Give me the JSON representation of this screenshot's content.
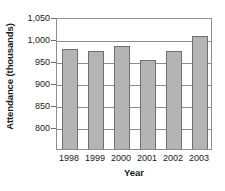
{
  "chart_data": {
    "type": "bar",
    "title": "",
    "subtitle": "",
    "xlabel": "Year",
    "ylabel": "Attendance (thousands)",
    "categories": [
      "1998",
      "1999",
      "2000",
      "2001",
      "2002",
      "2003"
    ],
    "values": [
      977,
      972,
      983,
      952,
      972,
      1006
    ],
    "series": [
      {
        "name": "Attendance",
        "values": [
          977,
          972,
          983,
          952,
          972,
          1006
        ]
      }
    ],
    "ylim": [
      800,
      1050
    ],
    "ytick_labels": [
      "800",
      "850",
      "900",
      "950",
      "1,000",
      "1,050"
    ],
    "ytick_values": [
      800,
      850,
      900,
      950,
      1000,
      1050
    ],
    "grid": "horizontal",
    "legend": "none",
    "bar_color": "#b4b4b4",
    "bar_border_color": "#707070",
    "axis_color": "#8d8d8d",
    "axis_note": "y-axis truncated; bars extend below the 800 gridline to the plot floor"
  }
}
